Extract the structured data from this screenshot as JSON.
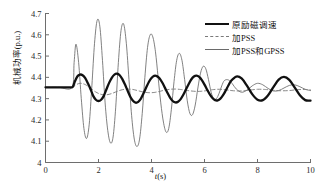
{
  "chart_data": {
    "type": "line",
    "title": "",
    "xlabel": "t(s)",
    "ylabel": "机械功率(p.u.)",
    "xlim": [
      0,
      10
    ],
    "ylim": [
      4,
      4.7
    ],
    "xticks": [
      "0",
      "2",
      "4",
      "6",
      "8",
      "10"
    ],
    "yticks": [
      "4",
      "4.1",
      "4.2",
      "4.3",
      "4.4",
      "4.5",
      "4.6",
      "4.7"
    ],
    "grid": false,
    "legend_position": "top-right",
    "disturbance_time": 1.0,
    "steady_state_value": 4.353,
    "series": [
      {
        "name": "原励磁调速",
        "style": "solid-thick",
        "color": "#111111",
        "x": [
          0,
          0.2,
          0.4,
          0.6,
          0.8,
          1.0,
          1.05,
          1.1,
          1.2,
          1.3,
          1.4,
          1.5,
          1.6,
          1.7,
          1.8,
          1.9,
          2.0,
          2.1,
          2.2,
          2.3,
          2.4,
          2.5,
          2.6,
          2.7,
          2.8,
          2.9,
          3.0,
          3.1,
          3.2,
          3.3,
          3.4,
          3.5,
          3.6,
          3.7,
          3.8,
          3.9,
          4.0,
          4.1,
          4.2,
          4.3,
          4.4,
          4.5,
          4.6,
          4.7,
          4.8,
          4.9,
          5.0,
          5.1,
          5.2,
          5.3,
          5.4,
          5.5,
          5.6,
          5.7,
          5.8,
          5.9,
          6.0,
          6.1,
          6.2,
          6.3,
          6.4,
          6.5,
          6.6,
          6.7,
          6.8,
          6.9,
          7.0,
          7.2,
          7.4,
          7.6,
          7.8,
          8.0,
          8.2,
          8.4,
          8.6,
          8.8,
          9.0,
          9.2,
          9.4,
          9.6,
          9.8,
          10.0
        ],
        "y": [
          4.353,
          4.353,
          4.353,
          4.353,
          4.353,
          4.353,
          4.36,
          4.378,
          4.404,
          4.413,
          4.41,
          4.396,
          4.372,
          4.344,
          4.313,
          4.295,
          4.289,
          4.295,
          4.313,
          4.344,
          4.374,
          4.398,
          4.413,
          4.417,
          4.41,
          4.392,
          4.366,
          4.337,
          4.309,
          4.29,
          4.281,
          4.285,
          4.3,
          4.325,
          4.352,
          4.378,
          4.397,
          4.407,
          4.406,
          4.396,
          4.377,
          4.353,
          4.328,
          4.305,
          4.289,
          4.282,
          4.285,
          4.298,
          4.318,
          4.343,
          4.368,
          4.39,
          4.404,
          4.408,
          4.402,
          4.387,
          4.366,
          4.342,
          4.32,
          4.303,
          4.293,
          4.292,
          4.3,
          4.316,
          4.338,
          4.362,
          4.383,
          4.404,
          4.395,
          4.361,
          4.321,
          4.295,
          4.293,
          4.316,
          4.354,
          4.389,
          4.402,
          4.388,
          4.353,
          4.316,
          4.293,
          4.291
        ]
      },
      {
        "name": "加PSS",
        "style": "dashed-thin",
        "color": "#7a7a7a",
        "x": [
          0,
          0.5,
          1.0,
          1.1,
          1.3,
          1.5,
          1.7,
          1.9,
          2.1,
          2.3,
          2.5,
          2.7,
          2.9,
          3.1,
          3.3,
          3.5,
          3.7,
          3.9,
          4.1,
          4.3,
          4.5,
          4.7,
          4.9,
          5.1,
          5.3,
          5.5,
          5.7,
          5.9,
          6.1,
          6.3,
          6.5,
          6.7,
          6.9,
          7.1,
          7.4,
          7.7,
          8.0,
          8.3,
          8.6,
          8.9,
          9.2,
          9.5,
          9.8,
          10.0
        ],
        "y": [
          4.353,
          4.353,
          4.353,
          4.362,
          4.372,
          4.366,
          4.349,
          4.331,
          4.32,
          4.318,
          4.324,
          4.334,
          4.342,
          4.345,
          4.343,
          4.337,
          4.331,
          4.328,
          4.329,
          4.334,
          4.34,
          4.344,
          4.345,
          4.343,
          4.339,
          4.336,
          4.334,
          4.335,
          4.338,
          4.342,
          4.344,
          4.343,
          4.34,
          4.337,
          4.336,
          4.34,
          4.344,
          4.343,
          4.339,
          4.337,
          4.338,
          4.342,
          4.343,
          4.341
        ]
      },
      {
        "name": "加PSS和GPSS",
        "style": "solid-thin",
        "color": "#6a6a6a",
        "x": [
          0,
          0.5,
          1.0,
          1.08,
          1.15,
          1.25,
          1.35,
          1.45,
          1.55,
          1.65,
          1.75,
          1.85,
          1.95,
          2.05,
          2.15,
          2.25,
          2.35,
          2.45,
          2.55,
          2.65,
          2.75,
          2.85,
          2.95,
          3.05,
          3.15,
          3.25,
          3.35,
          3.45,
          3.55,
          3.65,
          3.75,
          3.85,
          3.95,
          4.05,
          4.15,
          4.25,
          4.35,
          4.45,
          4.55,
          4.65,
          4.75,
          4.85,
          4.95,
          5.05,
          5.15,
          5.25,
          5.35,
          5.45,
          5.55,
          5.65,
          5.75,
          5.85,
          5.95,
          6.05,
          6.15,
          6.25,
          6.35,
          6.45,
          6.55,
          6.65,
          6.75,
          6.9,
          7.05,
          7.2,
          7.4,
          7.6,
          7.8,
          8.0,
          8.2,
          8.4,
          8.6,
          8.8,
          9.0,
          9.2,
          9.4,
          9.6,
          9.8,
          10.0
        ],
        "y": [
          4.353,
          4.353,
          4.353,
          4.47,
          4.556,
          4.47,
          4.3,
          4.16,
          4.113,
          4.18,
          4.36,
          4.56,
          4.668,
          4.64,
          4.48,
          4.28,
          4.15,
          4.092,
          4.12,
          4.26,
          4.47,
          4.62,
          4.65,
          4.56,
          4.39,
          4.22,
          4.11,
          4.075,
          4.11,
          4.23,
          4.4,
          4.54,
          4.6,
          4.59,
          4.52,
          4.4,
          4.28,
          4.19,
          4.143,
          4.16,
          4.25,
          4.38,
          4.48,
          4.513,
          4.48,
          4.39,
          4.29,
          4.23,
          4.225,
          4.27,
          4.35,
          4.42,
          4.452,
          4.44,
          4.39,
          4.33,
          4.3,
          4.3,
          4.325,
          4.36,
          4.385,
          4.388,
          4.37,
          4.345,
          4.33,
          4.34,
          4.36,
          4.372,
          4.365,
          4.348,
          4.336,
          4.338,
          4.35,
          4.362,
          4.365,
          4.356,
          4.344,
          4.338
        ]
      }
    ]
  },
  "legend": {
    "items": [
      {
        "label": "原励磁调速",
        "style": "solid-thick"
      },
      {
        "label": "加PSS",
        "style": "dashed-thin"
      },
      {
        "label": "加PSS和GPSS",
        "style": "solid-thin"
      }
    ]
  },
  "axes": {
    "x_title": "t(s)",
    "y_title": "机械功率(p.u.)"
  }
}
